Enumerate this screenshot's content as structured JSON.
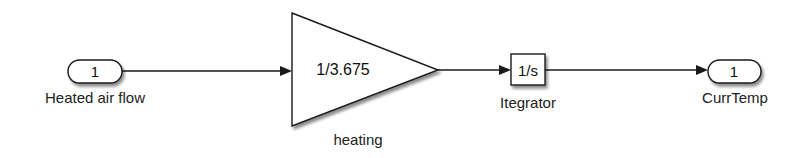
{
  "diagram": {
    "type": "simulink-block-diagram",
    "blocks": [
      {
        "id": "inport",
        "kind": "Inport",
        "port_number": "1",
        "label": "Heated air flow"
      },
      {
        "id": "gain",
        "kind": "Gain",
        "value": "1/3.675",
        "label": "heating"
      },
      {
        "id": "integrator",
        "kind": "Integrator",
        "value": "1/s",
        "label": "Itegrator"
      },
      {
        "id": "outport",
        "kind": "Outport",
        "port_number": "1",
        "label": "CurrTemp"
      }
    ],
    "connections": [
      {
        "from": "inport",
        "to": "gain"
      },
      {
        "from": "gain",
        "to": "integrator"
      },
      {
        "from": "integrator",
        "to": "outport"
      }
    ],
    "colors": {
      "line": "#1a1a1a",
      "block_fill": "#ffffff",
      "shadow": "#9a9a9a",
      "text": "#222222"
    }
  }
}
